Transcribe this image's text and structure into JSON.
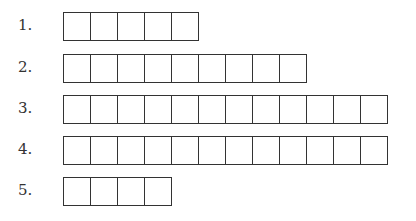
{
  "rows": [
    {
      "label": "1.",
      "boxes": 5,
      "top": 12
    },
    {
      "label": "2.",
      "boxes": 9,
      "top": 54
    },
    {
      "label": "3.",
      "boxes": 12,
      "top": 95
    },
    {
      "label": "4.",
      "boxes": 12,
      "top": 136
    },
    {
      "label": "5.",
      "boxes": 4,
      "top": 177
    }
  ]
}
